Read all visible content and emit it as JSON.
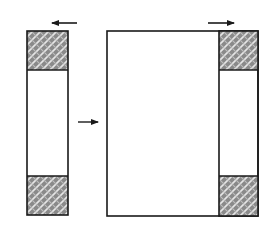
{
  "diagram": {
    "colors": {
      "stroke": "#1a1a1a",
      "fill": "#ffffff",
      "hatch_base": "#8a8a8a",
      "hatch_light": "#e6e6e6"
    },
    "elements": {
      "left_strip": {
        "x": 27,
        "y": 31,
        "w": 41,
        "h": 184,
        "top_hatch_h": 39,
        "bottom_hatch_h": 39
      },
      "main_rect": {
        "x": 107,
        "y": 31,
        "w": 151,
        "h": 185
      },
      "right_strip": {
        "x": 219,
        "y": 31,
        "w": 39,
        "h": 185,
        "top_hatch_h": 39,
        "bottom_hatch_h": 40
      },
      "arrows": [
        {
          "name": "left-arrow",
          "direction": "left",
          "x1": 77,
          "x2": 52,
          "y": 23
        },
        {
          "name": "right-arrow",
          "direction": "right",
          "x1": 208,
          "x2": 234,
          "y": 23
        },
        {
          "name": "middle-arrow",
          "direction": "right",
          "x1": 78,
          "x2": 98,
          "y": 122
        }
      ]
    }
  }
}
